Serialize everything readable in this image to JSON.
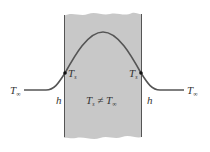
{
  "diagram": {
    "colors": {
      "slab_fill": "#c8c8c8",
      "slab_edge": "#555555",
      "curve": "#555555",
      "point": "#111111",
      "text": "#333333"
    },
    "labels": {
      "t_inf_left": {
        "main": "T",
        "sub": "∞"
      },
      "t_inf_right": {
        "main": "T",
        "sub": "∞"
      },
      "ts_left": {
        "main": "T",
        "sub": "s"
      },
      "ts_right": {
        "main": "T",
        "sub": "s"
      },
      "h_left": "h",
      "h_right": "h",
      "center": {
        "main": "T",
        "sub1": "s",
        "op": " ≠ ",
        "main2": "T",
        "sub2": "∞"
      }
    }
  }
}
